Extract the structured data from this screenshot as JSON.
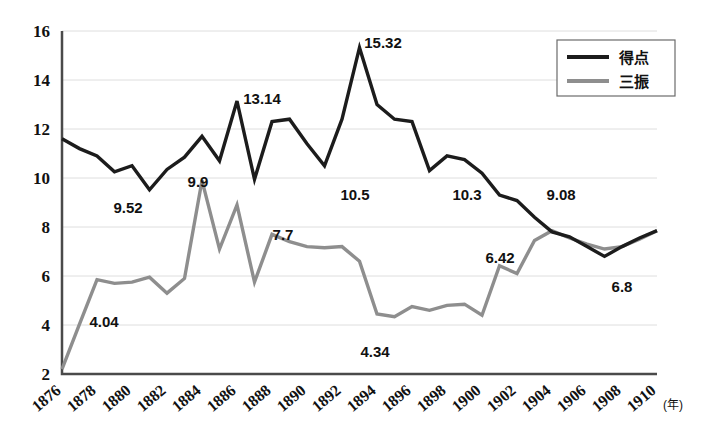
{
  "chart_data": {
    "type": "line",
    "title": "",
    "xlabel": "(年)",
    "ylabel": "",
    "xlim": [
      1876,
      1910
    ],
    "ylim": [
      2,
      16
    ],
    "ytick_step": 2,
    "xtick_step": 2,
    "grid": true,
    "legend_position": "top-right",
    "x": [
      1876,
      1877,
      1878,
      1879,
      1880,
      1881,
      1882,
      1883,
      1884,
      1885,
      1886,
      1887,
      1888,
      1889,
      1890,
      1891,
      1892,
      1893,
      1894,
      1895,
      1896,
      1897,
      1898,
      1899,
      1900,
      1901,
      1902,
      1903,
      1904,
      1905,
      1906,
      1907,
      1908,
      1909,
      1910
    ],
    "xtick_labels": [
      "1876",
      "1878",
      "1880",
      "1882",
      "1884",
      "1886",
      "1888",
      "1890",
      "1892",
      "1894",
      "1896",
      "1898",
      "1900",
      "1902",
      "1904",
      "1906",
      "1908",
      "1910"
    ],
    "ytick_labels": [
      "2",
      "4",
      "6",
      "8",
      "10",
      "12",
      "14",
      "16"
    ],
    "series": [
      {
        "name": "得点",
        "color": "#1c1c1c",
        "values": [
          11.6,
          11.2,
          10.9,
          10.25,
          10.5,
          9.52,
          10.35,
          10.85,
          11.7,
          10.7,
          13.14,
          9.95,
          12.3,
          12.4,
          11.4,
          10.5,
          12.4,
          15.32,
          13.0,
          12.4,
          12.3,
          10.3,
          10.9,
          10.75,
          10.2,
          9.3,
          9.08,
          8.4,
          7.8,
          7.6,
          7.2,
          6.8,
          7.2,
          7.55,
          7.85
        ]
      },
      {
        "name": "三振",
        "color": "#8e8e8e",
        "values": [
          2.2,
          4.04,
          5.85,
          5.7,
          5.75,
          5.95,
          5.3,
          5.9,
          9.9,
          7.1,
          8.9,
          5.75,
          7.7,
          7.4,
          7.2,
          7.15,
          7.2,
          6.6,
          4.45,
          4.34,
          4.75,
          4.6,
          4.8,
          4.85,
          4.4,
          6.42,
          6.1,
          7.45,
          7.85,
          7.55,
          7.3,
          7.1,
          7.2,
          7.5,
          7.85
        ]
      }
    ],
    "annotations": [
      {
        "text": "9.52",
        "year": 1881,
        "value": 9.52,
        "series": "得点"
      },
      {
        "text": "13.14",
        "year": 1886,
        "value": 13.14,
        "series": "得点"
      },
      {
        "text": "10.5",
        "year": 1891,
        "value": 10.5,
        "series": "得点"
      },
      {
        "text": "15.32",
        "year": 1893,
        "value": 15.32,
        "series": "得点"
      },
      {
        "text": "10.3",
        "year": 1897,
        "value": 10.3,
        "series": "得点"
      },
      {
        "text": "9.08",
        "year": 1902,
        "value": 9.08,
        "series": "得点"
      },
      {
        "text": "6.8",
        "year": 1907,
        "value": 6.8,
        "series": "得点"
      },
      {
        "text": "4.04",
        "year": 1877,
        "value": 4.04,
        "series": "三振"
      },
      {
        "text": "9.9",
        "year": 1884,
        "value": 9.9,
        "series": "三振"
      },
      {
        "text": "7.7",
        "year": 1888,
        "value": 7.7,
        "series": "三振"
      },
      {
        "text": "4.34",
        "year": 1895,
        "value": 4.34,
        "series": "三振"
      },
      {
        "text": "6.42",
        "year": 1901,
        "value": 6.42,
        "series": "三振"
      }
    ]
  },
  "legend": {
    "items": [
      {
        "label": "得点",
        "color": "#1c1c1c"
      },
      {
        "label": "三振",
        "color": "#8e8e8e"
      }
    ]
  },
  "axis": {
    "x_unit": "(年)"
  },
  "annotation_positions": [
    {
      "key": "9.52",
      "x": 128,
      "y": 213
    },
    {
      "key": "13.14",
      "x": 262,
      "y": 104
    },
    {
      "key": "10.5",
      "x": 355,
      "y": 200
    },
    {
      "key": "15.32",
      "x": 383,
      "y": 48
    },
    {
      "key": "10.3",
      "x": 467,
      "y": 200
    },
    {
      "key": "9.08",
      "x": 561,
      "y": 200
    },
    {
      "key": "6.8",
      "x": 622,
      "y": 292
    },
    {
      "key": "4.04",
      "x": 104,
      "y": 327
    },
    {
      "key": "9.9",
      "x": 198,
      "y": 187
    },
    {
      "key": "7.7",
      "x": 283,
      "y": 240
    },
    {
      "key": "4.34",
      "x": 375,
      "y": 357
    },
    {
      "key": "6.42",
      "x": 500,
      "y": 263
    }
  ]
}
